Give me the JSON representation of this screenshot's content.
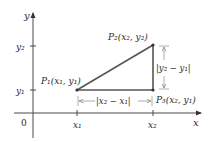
{
  "diagram": {
    "type": "distance-between-points",
    "axes": {
      "x_label": "x",
      "y_label": "y",
      "origin_label": "0",
      "x_ticks": [
        "x₁",
        "x₂"
      ],
      "y_ticks": [
        "y₁",
        "y₂"
      ]
    },
    "points": [
      {
        "name": "P₁",
        "coords": "(x₁, y₁)",
        "label": "P₁(x₁, y₁)"
      },
      {
        "name": "P₂",
        "coords": "(x₂, y₂)",
        "label": "P₂(x₂, y₂)"
      },
      {
        "name": "P₃",
        "coords": "(x₂, y₁)",
        "label": "P₃(x₂, y₁)"
      }
    ],
    "measurements": {
      "horizontal": "|x₂ − x₁|",
      "vertical": "|y₂ − y₁|"
    },
    "colors": {
      "axis": "#4a4a4a",
      "triangle": "#555555",
      "measurement": "#9a9a9a",
      "text": "#2b2b2b"
    }
  }
}
